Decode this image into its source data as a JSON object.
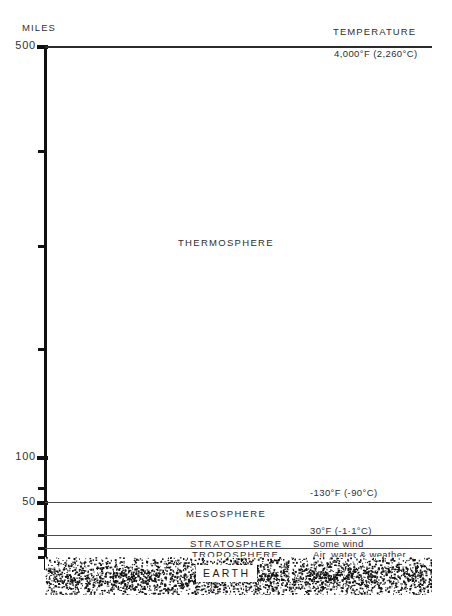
{
  "chart_data": {
    "type": "diagram",
    "ylabel": "MILES",
    "ylim": [
      0,
      500
    ],
    "axis_ticks": [
      {
        "value": 500,
        "label": "500",
        "major": true
      },
      {
        "value": 400,
        "label": "",
        "major": false
      },
      {
        "value": 300,
        "label": "",
        "major": false
      },
      {
        "value": 200,
        "label": "",
        "major": false
      },
      {
        "value": 100,
        "label": "100",
        "major": true
      },
      {
        "value": 70,
        "label": "",
        "major": false
      },
      {
        "value": 50,
        "label": "50",
        "major": true
      },
      {
        "value": 35,
        "label": "",
        "major": false
      },
      {
        "value": 20,
        "label": "",
        "major": false
      },
      {
        "value": 10,
        "label": "",
        "major": false
      },
      {
        "value": 0,
        "label": "",
        "major": false
      }
    ],
    "column_header_right": "TEMPERATURE",
    "layers": [
      {
        "name": "THERMOSPHERE",
        "top_miles": 500,
        "bottom_miles": 50
      },
      {
        "name": "MESOSPHERE",
        "top_miles": 50,
        "bottom_miles": 20
      },
      {
        "name": "STRATOSPHERE",
        "top_miles": 20,
        "bottom_miles": 10
      },
      {
        "name": "TROPOSPHERE",
        "top_miles": 10,
        "bottom_miles": 0
      }
    ],
    "temperature_annotations": [
      {
        "at_miles": 500,
        "label": "4,000°F (2,260°C)"
      },
      {
        "at_miles": 50,
        "label": "-130°F (-90°C)"
      },
      {
        "at_miles": 20,
        "label": "30°F (-1·1°C)"
      }
    ],
    "feature_annotations": [
      {
        "layer": "STRATOSPHERE",
        "label": "Some wind"
      },
      {
        "layer": "TROPOSPHERE",
        "label": "Air, water & weather"
      }
    ],
    "ground_label": "EARTH"
  },
  "axis": {
    "title": "MILES",
    "tick_500": "500",
    "tick_100": "100",
    "tick_50": "50"
  },
  "header": {
    "temperature": "TEMPERATURE"
  },
  "layers": {
    "thermosphere": "THERMOSPHERE",
    "mesosphere": "MESOSPHERE",
    "stratosphere": "STRATOSPHERE",
    "troposphere": "TROPOSPHERE"
  },
  "temps": {
    "top": "4,000°F (2,260°C)",
    "mesopause": "-130°F (-90°C)",
    "stratopause": "30°F (-1·1°C)"
  },
  "notes": {
    "stratosphere": "Some wind",
    "troposphere": "Air, water & weather"
  },
  "ground": {
    "label": "EARTH"
  },
  "colors": {
    "ink": "#1a1a1a",
    "rule": "#4a4a4a",
    "paper": "#ffffff"
  }
}
